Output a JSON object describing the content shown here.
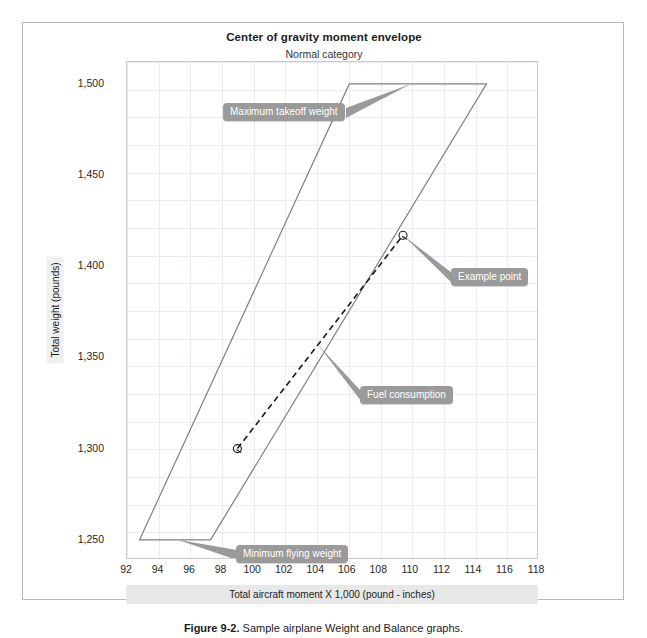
{
  "chart_data": {
    "type": "line",
    "title": "Center of gravity moment envelope",
    "subtitle": "Normal category",
    "xlabel": "Total aircraft moment X 1,000 (pound - inches)",
    "ylabel": "Total weight (pounds)",
    "xlim": [
      92,
      118
    ],
    "ylim": [
      1240,
      1512
    ],
    "xticks": [
      92,
      94,
      96,
      98,
      100,
      102,
      104,
      106,
      108,
      110,
      112,
      114,
      116,
      118
    ],
    "yticks": [
      1250,
      1300,
      1350,
      1400,
      1450,
      1500
    ],
    "ytick_labels": [
      "1,250",
      "1,300",
      "1,350",
      "1,400",
      "1,450",
      "1,500"
    ],
    "grid": true,
    "legend_position": "none",
    "series": [
      {
        "name": "Center of gravity moment envelope",
        "style": "solid",
        "color": "#808080",
        "closed": true,
        "points": [
          {
            "x": 92.8,
            "y": 1250
          },
          {
            "x": 106.1,
            "y": 1500
          },
          {
            "x": 114.8,
            "y": 1500
          },
          {
            "x": 97.3,
            "y": 1250
          },
          {
            "x": 92.8,
            "y": 1250
          }
        ]
      },
      {
        "name": "Fuel consumption",
        "style": "dashed",
        "color": "#1a1a1a",
        "closed": false,
        "points": [
          {
            "x": 99.0,
            "y": 1300
          },
          {
            "x": 109.5,
            "y": 1417
          }
        ]
      }
    ],
    "markers": [
      {
        "name": "loaded-aircraft-point",
        "x": 99.0,
        "y": 1300
      },
      {
        "name": "example-point",
        "x": 109.5,
        "y": 1417
      }
    ],
    "annotations": [
      {
        "id": "max-takeoff-weight",
        "label": "Maximum takeoff weight",
        "target_x": 110.0,
        "target_y": 1500
      },
      {
        "id": "example-point",
        "label": "Example point",
        "target_x": 109.5,
        "target_y": 1417
      },
      {
        "id": "fuel-consumption",
        "label": "Fuel consumption",
        "target_x": 104.1,
        "target_y": 1357
      },
      {
        "id": "minimum-flying-weight",
        "label": "Minimum flying weight",
        "target_x": 95.2,
        "target_y": 1250
      }
    ]
  },
  "caption": {
    "prefix": "Figure 9-2.",
    "text": "Sample airplane Weight and Balance graphs."
  },
  "colors": {
    "envelope": "#808080",
    "fuel_line": "#1a1a1a",
    "grid": "#e9edf2",
    "callout_bg": "#9a9a9a",
    "axis_band": "#e8e8e8"
  }
}
